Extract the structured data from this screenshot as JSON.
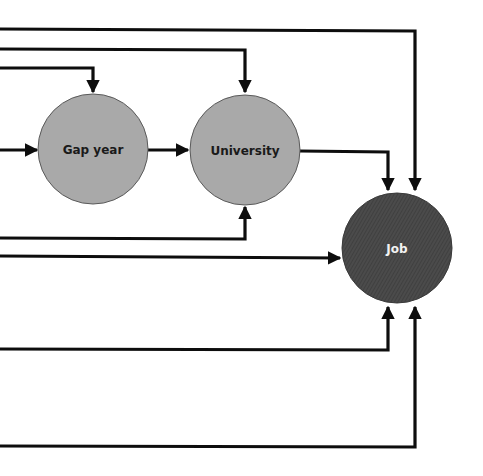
{
  "diagram": {
    "type": "flow",
    "background": "#ffffff",
    "colors": {
      "light_node_fill": "#a9a9a9",
      "light_node_stroke": "#5a5a5a",
      "dark_node_fill": "#4b4b4b",
      "dark_node_hatch": "#3a3a3a",
      "dark_node_text": "#f2f2f2",
      "light_node_text": "#1a1a1a",
      "edge": "#0d0d0d"
    },
    "nodes": [
      {
        "id": "gap_year",
        "label": "Gap year",
        "style": "light"
      },
      {
        "id": "university",
        "label": "University",
        "style": "light"
      },
      {
        "id": "job",
        "label": "Job",
        "style": "dark"
      }
    ],
    "edges": [
      {
        "from": "off-canvas-left",
        "to": "job",
        "note": "top line entering Job from above (right)"
      },
      {
        "from": "off-canvas-left",
        "to": "university",
        "note": "enters University from above"
      },
      {
        "from": "off-canvas-left",
        "to": "gap_year",
        "note": "enters Gap year from above"
      },
      {
        "from": "off-canvas-left",
        "to": "gap_year",
        "note": "enters Gap year from left"
      },
      {
        "from": "gap_year",
        "to": "university"
      },
      {
        "from": "university",
        "to": "job",
        "note": "enters Job from above (left)"
      },
      {
        "from": "off-canvas-left",
        "to": "university",
        "note": "enters University from below"
      },
      {
        "from": "off-canvas-left",
        "to": "job",
        "note": "enters Job from left"
      },
      {
        "from": "off-canvas-left",
        "to": "job",
        "note": "enters Job from below (left)"
      },
      {
        "from": "off-canvas-left",
        "to": "job",
        "note": "enters Job from below (right)"
      }
    ]
  }
}
